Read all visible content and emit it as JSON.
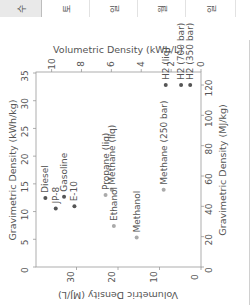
{
  "tabs": [
    {
      "label": "수",
      "active": true
    },
    {
      "label": "토",
      "active": false
    },
    {
      "label": "일",
      "active": false
    },
    {
      "label": "월",
      "active": false
    },
    {
      "label": "일",
      "active": false
    }
  ],
  "chart_data": {
    "type": "scatter",
    "orientation": "rotated -90deg",
    "title": "",
    "xlabel": "Gravimetric Density (MJ/kg)",
    "ylabel": "Volumetric Density (MJ/L)",
    "x2label": "Gravimetric Density (kWh/kg)",
    "y2label": "Volumetric Density (kWh/L)",
    "xlim": [
      0,
      120
    ],
    "ylim": [
      0,
      40
    ],
    "x_ticks": [
      0,
      20,
      40,
      60,
      80,
      100,
      120
    ],
    "y_ticks": [
      0,
      10,
      20,
      30
    ],
    "x2_ticks": [
      0,
      5,
      10,
      15,
      20,
      25,
      30,
      35
    ],
    "y2_ticks": [
      0,
      2,
      4,
      6,
      8,
      10
    ],
    "grid": false,
    "points": [
      {
        "label": "Diesel",
        "x": 45.5,
        "y": 37.5,
        "color": "#555555"
      },
      {
        "label": "JP-8",
        "x": 38.5,
        "y": 35.0,
        "color": "#555555"
      },
      {
        "label": "Gasoline",
        "x": 46.4,
        "y": 33.0,
        "color": "#555555"
      },
      {
        "label": "E-10",
        "x": 40.0,
        "y": 30.5,
        "color": "#555555"
      },
      {
        "label": "Propane (liq)",
        "x": 47.5,
        "y": 23.0,
        "color": "#aaaaaa"
      },
      {
        "label": "Methane (liq)",
        "x": 51.0,
        "y": 21.5,
        "color": "#aaaaaa"
      },
      {
        "label": "Ethanol",
        "x": 27.0,
        "y": 21.0,
        "color": "#aaaaaa"
      },
      {
        "label": "Methanol",
        "x": 19.5,
        "y": 15.5,
        "color": "#aaaaaa"
      },
      {
        "label": "Methane (250 bar)",
        "x": 51.0,
        "y": 9.0,
        "color": "#aaaaaa"
      },
      {
        "label": "H2 (liq)",
        "x": 120.0,
        "y": 8.5,
        "color": "#555555"
      },
      {
        "label": "H2 (700 bar)",
        "x": 120.0,
        "y": 4.8,
        "color": "#555555"
      },
      {
        "label": "H2 (350 bar)",
        "x": 120.0,
        "y": 2.6,
        "color": "#555555"
      }
    ]
  }
}
